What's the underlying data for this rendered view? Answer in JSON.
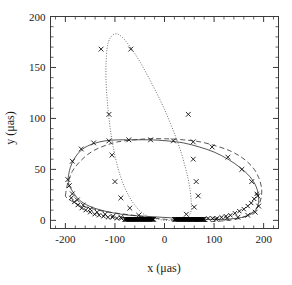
{
  "chart_data": {
    "type": "scatter",
    "title": "",
    "xlabel": "x (μas)",
    "ylabel": "y (μas)",
    "xlim": [
      -230,
      230
    ],
    "ylim": [
      -8,
      200
    ],
    "xticks": [
      -200,
      -100,
      0,
      100,
      200
    ],
    "yticks": [
      0,
      50,
      100,
      150,
      200
    ],
    "xtick_labels": [
      "-200",
      "-100",
      "0",
      "100",
      "200"
    ],
    "ytick_labels": [
      "0",
      "50",
      "100",
      "150",
      "200"
    ],
    "minor_tick_step_x": 20,
    "minor_tick_step_y": 10,
    "grid": false,
    "legend": "none",
    "frame": "box",
    "tick_direction": "in",
    "series": [
      {
        "name": "outer-solid-ellipse",
        "style": "solid",
        "marker": "cross",
        "comment": "Upper photocenter ellipse, solid line, x markers spaced along it",
        "x": [
          -195,
          -190,
          -180,
          -165,
          -145,
          -120,
          -92,
          -60,
          -28,
          5,
          38,
          70,
          100,
          128,
          152,
          172,
          185,
          190,
          188,
          180,
          165,
          145,
          120,
          92,
          60,
          28,
          -5,
          -38,
          -70,
          -100,
          -128,
          -152,
          -172,
          -185,
          -192,
          -195
        ],
        "y": [
          40,
          52,
          62,
          70,
          75,
          78,
          79,
          79,
          79,
          78,
          76,
          72,
          67,
          60,
          52,
          43,
          33,
          22,
          14,
          8,
          4,
          2,
          1,
          1,
          1,
          2,
          3,
          4,
          5,
          7,
          10,
          14,
          20,
          28,
          34,
          40
        ]
      },
      {
        "name": "inner-dashed-ellipse",
        "style": "dashed",
        "marker": "none",
        "comment": "Second orbit, long-dashed, slightly offset and rotated relative to the solid one",
        "x": [
          -200,
          -196,
          -186,
          -170,
          -148,
          -122,
          -94,
          -62,
          -30,
          4,
          38,
          72,
          104,
          133,
          158,
          178,
          190,
          196,
          194,
          186,
          172,
          152,
          128,
          100,
          68,
          36,
          2,
          -32,
          -64,
          -96,
          -124,
          -150,
          -172,
          -188,
          -197,
          -200
        ],
        "y": [
          24,
          35,
          48,
          58,
          67,
          73,
          77,
          79,
          80,
          80,
          79,
          77,
          73,
          68,
          61,
          52,
          42,
          31,
          20,
          12,
          6,
          2,
          0,
          -1,
          -1,
          0,
          1,
          3,
          5,
          7,
          9,
          12,
          15,
          19,
          22,
          24
        ]
      },
      {
        "name": "tall-dotted-loop",
        "style": "dotted",
        "marker": "cross",
        "comment": "Steeply inclined highly eccentric orbit forming a narrow tall loop peaking near y=183",
        "x": [
          -22,
          -38,
          -55,
          -72,
          -88,
          -102,
          -112,
          -118,
          -116,
          -108,
          -96,
          -82,
          -66,
          -50,
          -34,
          -18,
          -2,
          12,
          24,
          34,
          42,
          48,
          52,
          54,
          54,
          50,
          44,
          36,
          26,
          14,
          0,
          -12,
          -22
        ],
        "y": [
          2,
          5,
          12,
          24,
          42,
          68,
          100,
          138,
          168,
          180,
          183,
          178,
          168,
          156,
          142,
          127,
          111,
          95,
          80,
          66,
          52,
          40,
          28,
          18,
          10,
          5,
          2,
          1,
          0,
          0,
          0,
          1,
          2
        ]
      }
    ],
    "markers": {
      "symbol": "x",
      "outer_ellipse_points": [
        [
          -195,
          40
        ],
        [
          -186,
          58
        ],
        [
          -168,
          70
        ],
        [
          -143,
          76
        ],
        [
          -112,
          78
        ],
        [
          -72,
          79
        ],
        [
          -28,
          79
        ],
        [
          18,
          78
        ],
        [
          58,
          77
        ],
        [
          96,
          72
        ],
        [
          128,
          62
        ],
        [
          156,
          50
        ],
        [
          176,
          38
        ],
        [
          188,
          24
        ],
        [
          190,
          14
        ],
        [
          183,
          8
        ],
        [
          168,
          5
        ],
        [
          148,
          3
        ],
        [
          126,
          2
        ],
        [
          104,
          1
        ],
        [
          -192,
          34
        ],
        [
          -186,
          26
        ],
        [
          -176,
          20
        ],
        [
          -164,
          15
        ],
        [
          -150,
          11
        ],
        [
          -136,
          8
        ],
        [
          -120,
          6
        ],
        [
          -104,
          4
        ],
        [
          -88,
          3
        ]
      ],
      "tall_loop_points": [
        [
          -128,
          168
        ],
        [
          -68,
          168
        ],
        [
          -112,
          104
        ],
        [
          48,
          104
        ],
        [
          -106,
          64
        ],
        [
          58,
          60
        ],
        [
          -100,
          38
        ],
        [
          64,
          38
        ],
        [
          -88,
          22
        ],
        [
          68,
          24
        ],
        [
          -70,
          12
        ],
        [
          60,
          13
        ],
        [
          -52,
          5
        ],
        [
          44,
          6
        ]
      ],
      "dense_cluster_left": {
        "x_start": -80,
        "x_end": -22,
        "y": 1,
        "count": 46,
        "comment": "Tightly packed x markers hugging y=0 from x=-80 to x=-22"
      },
      "dense_cluster_right": {
        "x_start": 20,
        "x_end": 80,
        "y": 1,
        "count": 46,
        "comment": "Tightly packed x markers hugging y=0 from x=20 to x=80"
      },
      "dense_arc_outer_left": {
        "comment": "Dense x markers along lower-left branch of outer ellipse",
        "points": [
          [
            -188,
            22
          ],
          [
            -182,
            18
          ],
          [
            -175,
            15
          ],
          [
            -167,
            12
          ],
          [
            -159,
            10
          ],
          [
            -150,
            8
          ],
          [
            -141,
            6
          ],
          [
            -132,
            5
          ],
          [
            -123,
            4
          ],
          [
            -114,
            3
          ],
          [
            -105,
            3
          ],
          [
            -96,
            2
          ],
          [
            -87,
            2
          ]
        ]
      },
      "dense_arc_outer_right": {
        "comment": "Dense x markers along lower-right branch of outer ellipse",
        "points": [
          [
            186,
            26
          ],
          [
            181,
            21
          ],
          [
            175,
            17
          ],
          [
            168,
            14
          ],
          [
            160,
            11
          ],
          [
            151,
            9
          ],
          [
            142,
            7
          ],
          [
            133,
            5
          ],
          [
            124,
            4
          ],
          [
            115,
            3
          ],
          [
            106,
            2
          ],
          [
            97,
            2
          ],
          [
            88,
            2
          ]
        ]
      }
    }
  },
  "axes": {
    "x_axis_name": "x-axis",
    "y_axis_name": "y-axis"
  }
}
